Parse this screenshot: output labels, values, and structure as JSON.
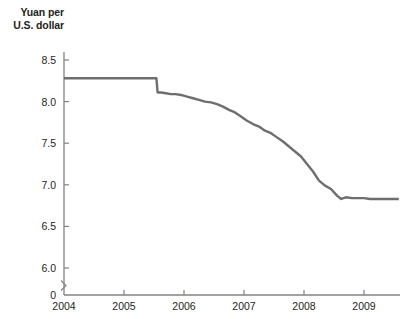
{
  "chart_data": {
    "type": "line",
    "title": "",
    "ylabel": "Yuan per U.S. dollar",
    "xlabel": "",
    "ylim": [
      5.95,
      8.55
    ],
    "xlim": [
      2004.0,
      2009.6
    ],
    "grid": false,
    "legend": null,
    "y_ticks": [
      "0",
      "6.0",
      "6.5",
      "7.0",
      "7.5",
      "8.0",
      "8.5"
    ],
    "y_tick_values": [
      0,
      6.0,
      6.5,
      7.0,
      7.5,
      8.0,
      8.5
    ],
    "x_ticks": [
      "2004",
      "2005",
      "2006",
      "2007",
      "2008",
      "2009"
    ],
    "x_tick_values": [
      2004,
      2005,
      2006,
      2007,
      2008,
      2009
    ],
    "axis_break": true,
    "line_color": "#6d6e70",
    "series": [
      {
        "name": "Yuan per U.S. dollar",
        "x": [
          2004.0,
          2004.2,
          2004.4,
          2004.6,
          2004.8,
          2005.0,
          2005.2,
          2005.4,
          2005.54,
          2005.56,
          2005.62,
          2005.7,
          2005.78,
          2005.86,
          2005.95,
          2006.05,
          2006.15,
          2006.25,
          2006.35,
          2006.45,
          2006.55,
          2006.65,
          2006.75,
          2006.85,
          2006.95,
          2007.05,
          2007.15,
          2007.25,
          2007.35,
          2007.45,
          2007.55,
          2007.65,
          2007.75,
          2007.85,
          2007.95,
          2008.05,
          2008.15,
          2008.25,
          2008.35,
          2008.45,
          2008.55,
          2008.62,
          2008.7,
          2008.8,
          2008.9,
          2009.0,
          2009.1,
          2009.2,
          2009.3,
          2009.4,
          2009.5,
          2009.58
        ],
        "y": [
          8.28,
          8.28,
          8.28,
          8.28,
          8.28,
          8.28,
          8.28,
          8.28,
          8.28,
          8.11,
          8.11,
          8.1,
          8.09,
          8.09,
          8.08,
          8.06,
          8.04,
          8.02,
          8.0,
          7.99,
          7.97,
          7.94,
          7.9,
          7.87,
          7.82,
          7.77,
          7.73,
          7.7,
          7.65,
          7.62,
          7.57,
          7.52,
          7.46,
          7.4,
          7.34,
          7.25,
          7.16,
          7.05,
          6.99,
          6.95,
          6.87,
          6.83,
          6.85,
          6.84,
          6.84,
          6.84,
          6.83,
          6.83,
          6.83,
          6.83,
          6.83,
          6.83
        ]
      }
    ]
  }
}
